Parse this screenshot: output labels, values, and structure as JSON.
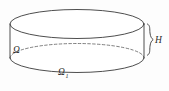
{
  "figure": {
    "kind": "cylinder-diagram",
    "background_color": "#fdfdfd",
    "stroke_color": "#3a3a3a",
    "hidden_edge_color": "#555555",
    "label_color": "#2b2b2b",
    "labels": {
      "side_domain": "Ω",
      "base_domain": "Ω",
      "base_domain_subscript": "1",
      "height": "H"
    },
    "geometry": {
      "top_ellipse_center_x": 77,
      "top_ellipse_center_y": 24,
      "top_ellipse_rx": 67,
      "top_ellipse_ry": 14.5,
      "bottom_ellipse_center_y": 58,
      "left_wall_x": 10,
      "right_wall_x": 144,
      "height_px": 34
    }
  }
}
